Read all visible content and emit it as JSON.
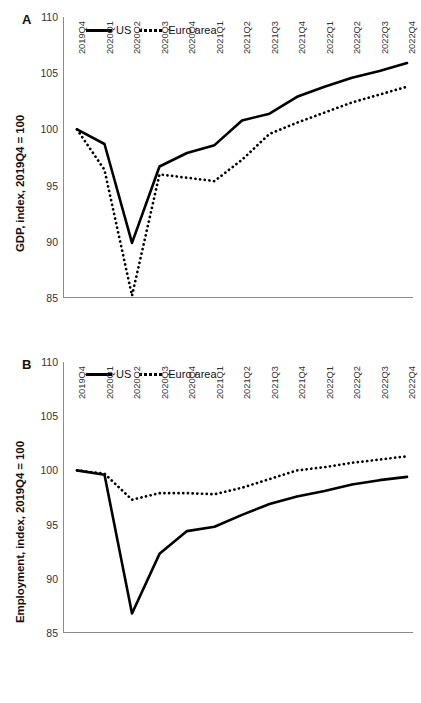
{
  "figure": {
    "background": "#ffffff",
    "ink": "#000000",
    "axis_color": "#8a8a8a"
  },
  "panels": [
    {
      "letter": "A",
      "ylabel": "GDP, index, 2019Q4 = 100",
      "legend": [
        {
          "label": "US",
          "style": "solid"
        },
        {
          "label": "Euro area",
          "style": "dotted"
        }
      ]
    },
    {
      "letter": "B",
      "ylabel": "Employment, index, 2019Q4 = 100",
      "legend": [
        {
          "label": "US",
          "style": "solid"
        },
        {
          "label": "Euro area",
          "style": "dotted"
        }
      ]
    }
  ],
  "chart_data": [
    {
      "type": "line",
      "panel": "A",
      "title": "",
      "xlabel": "",
      "ylabel": "GDP, index, 2019Q4 = 100",
      "ylim": [
        85,
        110
      ],
      "yticks": [
        85,
        90,
        95,
        100,
        105,
        110
      ],
      "grid": false,
      "legend_position": "top-left",
      "categories": [
        "2019Q4",
        "2020Q1",
        "2020Q2",
        "2020Q3",
        "2020Q4",
        "2021Q1",
        "2021Q2",
        "2021Q3",
        "2021Q4",
        "2022Q1",
        "2022Q2",
        "2022Q3",
        "2022Q4"
      ],
      "series": [
        {
          "name": "US",
          "style": "solid",
          "values": [
            100.0,
            98.7,
            89.9,
            96.7,
            97.9,
            98.6,
            100.8,
            101.4,
            102.9,
            103.8,
            104.6,
            105.2,
            105.9
          ]
        },
        {
          "name": "Euro area",
          "style": "dotted",
          "values": [
            100.0,
            96.4,
            85.2,
            96.0,
            95.7,
            95.4,
            97.3,
            99.6,
            100.6,
            101.5,
            102.4,
            103.1,
            103.8
          ]
        }
      ]
    },
    {
      "type": "line",
      "panel": "B",
      "title": "",
      "xlabel": "",
      "ylabel": "Employment, index, 2019Q4 = 100",
      "ylim": [
        85,
        110
      ],
      "yticks": [
        85,
        90,
        95,
        100,
        105,
        110
      ],
      "grid": false,
      "legend_position": "top-left",
      "categories": [
        "2019Q4",
        "2020Q1",
        "2020Q2",
        "2020Q3",
        "2020Q4",
        "2021Q1",
        "2021Q2",
        "2021Q3",
        "2021Q4",
        "2022Q1",
        "2022Q2",
        "2022Q3",
        "2022Q4"
      ],
      "series": [
        {
          "name": "US",
          "style": "solid",
          "values": [
            100.0,
            99.6,
            86.8,
            92.3,
            94.4,
            94.8,
            95.9,
            96.9,
            97.6,
            98.1,
            98.7,
            99.1,
            99.4
          ]
        },
        {
          "name": "Euro area",
          "style": "dotted",
          "values": [
            100.0,
            99.7,
            97.3,
            97.9,
            97.9,
            97.8,
            98.4,
            99.2,
            100.0,
            100.3,
            100.7,
            101.0,
            101.3
          ]
        }
      ]
    }
  ]
}
